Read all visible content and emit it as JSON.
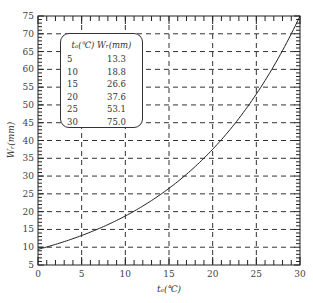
{
  "chart_data": {
    "type": "line",
    "title": "",
    "xlabel": "t_d(℃)",
    "ylabel": "W_r(mm)",
    "xlim": [
      0,
      30
    ],
    "ylim": [
      5,
      75
    ],
    "x_ticks": [
      0,
      5,
      10,
      15,
      20,
      25,
      30
    ],
    "y_ticks": [
      5,
      10,
      15,
      20,
      25,
      30,
      35,
      40,
      45,
      50,
      55,
      60,
      65,
      70,
      75
    ],
    "grid": "dashed",
    "series": [
      {
        "name": "W_r vs t_d",
        "x": [
          0,
          5,
          10,
          15,
          20,
          25,
          30
        ],
        "values": [
          9.4,
          13.3,
          18.8,
          26.6,
          37.6,
          53.1,
          75.0
        ]
      }
    ],
    "table": {
      "header": [
        "t_d(℃)",
        "W_r(mm)"
      ],
      "rows": [
        [
          "5",
          "13.3"
        ],
        [
          "10",
          "18.8"
        ],
        [
          "15",
          "26.6"
        ],
        [
          "20",
          "37.6"
        ],
        [
          "25",
          "53.1"
        ],
        [
          "30",
          "75.0"
        ]
      ]
    }
  },
  "legend": {
    "header": "tₐ(℃) Wᵣ(mm)",
    "rows": [
      {
        "t": "5",
        "w": "13.3"
      },
      {
        "t": "10",
        "w": "18.8"
      },
      {
        "t": "15",
        "w": "26.6"
      },
      {
        "t": "20",
        "w": "37.6"
      },
      {
        "t": "25",
        "w": "53.1"
      },
      {
        "t": "30",
        "w": "75.0"
      }
    ]
  },
  "labels": {
    "x_axis": "tₐ(℃)",
    "y_axis": "Wᵣ(mm)"
  }
}
